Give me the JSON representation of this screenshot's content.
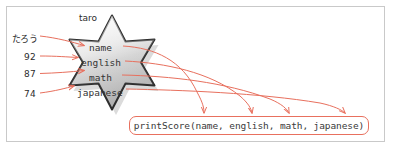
{
  "diagram": {
    "object_label": "taro",
    "inputs": [
      {
        "value": "たろう",
        "target_field": "name"
      },
      {
        "value": "92",
        "target_field": "english"
      },
      {
        "value": "87",
        "target_field": "math"
      },
      {
        "value": "74",
        "target_field": "japanese"
      }
    ],
    "object_fields": [
      {
        "name": "name"
      },
      {
        "name": "english"
      },
      {
        "name": "math"
      },
      {
        "name": "japanese"
      }
    ],
    "function_call": {
      "text": "printScore(name, english, math, japanese)",
      "function_name": "printScore",
      "arguments": [
        "name",
        "english",
        "math",
        "japanese"
      ]
    },
    "colors": {
      "arrow": "#e8705e",
      "box_border": "#e8705e",
      "star_fill_light": "#eeeeee",
      "star_fill_dark": "#b4b4b4",
      "star_outline": "#2d2d2d",
      "frame_border": "#c9c9c9",
      "text": "#333333"
    },
    "shape": {
      "kind": "six-pointed-star",
      "style": "glossy-gray-with-shadow"
    }
  }
}
